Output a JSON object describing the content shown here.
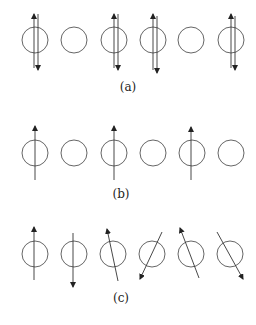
{
  "panels": [
    {
      "label": "(a)",
      "description": "Antiparallel pairs of spins on alternating sites",
      "sites": [
        {
          "x": 35,
          "occupied": true,
          "spins": [
            "up",
            "down"
          ]
        },
        {
          "x": 74,
          "occupied": false,
          "spins": []
        },
        {
          "x": 114,
          "occupied": true,
          "spins": [
            "up",
            "down"
          ]
        },
        {
          "x": 153,
          "occupied": true,
          "spins": [
            "up",
            "down"
          ]
        },
        {
          "x": 191,
          "occupied": false,
          "spins": []
        },
        {
          "x": 231,
          "occupied": true,
          "spins": [
            "up",
            "down"
          ]
        }
      ]
    },
    {
      "label": "(b)",
      "description": "Single up spins on alternating sites",
      "sites": [
        {
          "x": 35,
          "occupied": true,
          "spins": [
            "up"
          ]
        },
        {
          "x": 74,
          "occupied": false,
          "spins": []
        },
        {
          "x": 114,
          "occupied": true,
          "spins": [
            "up"
          ]
        },
        {
          "x": 153,
          "occupied": false,
          "spins": []
        },
        {
          "x": 192,
          "occupied": true,
          "spins": [
            "up"
          ]
        },
        {
          "x": 231,
          "occupied": false,
          "spins": []
        }
      ]
    },
    {
      "label": "(c)",
      "description": "Spins with varied orientations on every site",
      "sites": [
        {
          "x": 35,
          "angle_deg": 0
        },
        {
          "x": 74,
          "angle_deg": 180
        },
        {
          "x": 113,
          "angle_deg": -15
        },
        {
          "x": 152,
          "angle_deg": -150
        },
        {
          "x": 191,
          "angle_deg": -30
        },
        {
          "x": 230,
          "angle_deg": 150
        }
      ]
    }
  ]
}
